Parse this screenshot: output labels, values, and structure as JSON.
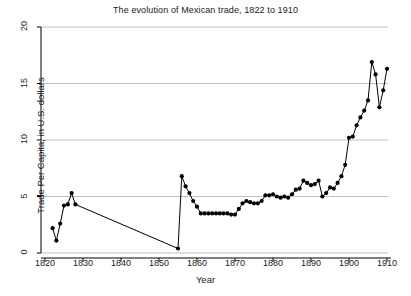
{
  "chart_data": {
    "type": "line",
    "title": "The evolution of Mexican trade, 1822 to 1910",
    "xlabel": "Year",
    "ylabel": "Trade Per Capita, in U.S. dollars",
    "xlim": [
      1818,
      1912
    ],
    "ylim": [
      0,
      20
    ],
    "xticks": [
      1820,
      1830,
      1840,
      1850,
      1860,
      1870,
      1880,
      1890,
      1900,
      1910
    ],
    "yticks": [
      0,
      5,
      10,
      15,
      20
    ],
    "grid": "horizontal",
    "legend": "none",
    "marker": "filled-circle",
    "line_color": "#000000",
    "marker_color": "#000000",
    "grid_color": "#b0b0b0",
    "axis_color": "#000000",
    "background": "#ffffff",
    "series": [
      {
        "name": "Trade Per Capita",
        "x": [
          1822,
          1823,
          1824,
          1825,
          1826,
          1827,
          1828,
          1855,
          1856,
          1857,
          1858,
          1859,
          1860,
          1861,
          1862,
          1863,
          1864,
          1865,
          1866,
          1867,
          1868,
          1869,
          1870,
          1871,
          1872,
          1873,
          1874,
          1875,
          1876,
          1877,
          1878,
          1879,
          1880,
          1881,
          1882,
          1883,
          1884,
          1885,
          1886,
          1887,
          1888,
          1889,
          1890,
          1891,
          1892,
          1893,
          1894,
          1895,
          1896,
          1897,
          1898,
          1899,
          1900,
          1901,
          1902,
          1903,
          1904,
          1905,
          1906,
          1907,
          1908,
          1909,
          1910
        ],
        "y": [
          2.2,
          1.1,
          2.6,
          4.2,
          4.3,
          5.3,
          4.3,
          0.4,
          6.8,
          5.9,
          5.3,
          4.6,
          4.1,
          3.5,
          3.5,
          3.5,
          3.5,
          3.5,
          3.5,
          3.5,
          3.5,
          3.4,
          3.4,
          3.9,
          4.4,
          4.6,
          4.5,
          4.4,
          4.4,
          4.6,
          5.1,
          5.1,
          5.2,
          5.0,
          4.9,
          5.0,
          4.9,
          5.2,
          5.6,
          5.7,
          6.4,
          6.2,
          6.0,
          6.1,
          6.4,
          5.0,
          5.3,
          5.8,
          5.7,
          6.2,
          6.8,
          7.8,
          10.2,
          10.3,
          11.3,
          12.0,
          12.6,
          13.5,
          16.9,
          15.8,
          12.9,
          14.4,
          16.3
        ]
      }
    ]
  }
}
